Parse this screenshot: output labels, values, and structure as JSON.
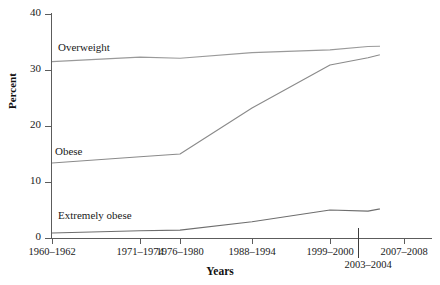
{
  "chart_data": {
    "type": "line",
    "title": "",
    "xlabel": "Years",
    "ylabel": "Percent",
    "categories": [
      "1960–1962",
      "1971–1974",
      "1976–1980",
      "1988–1994",
      "1999–2000",
      "2003–2004",
      "2007–2008"
    ],
    "ylim": [
      0,
      40
    ],
    "yticks": [
      0,
      10,
      20,
      30,
      40
    ],
    "ytick_labels": [
      "0",
      "10",
      "20",
      "30",
      "40"
    ],
    "grid": false,
    "legend": "inline-series-labels",
    "series": [
      {
        "name": "Overweight",
        "color": "#9a9a9a",
        "values": [
          31.5,
          32.3,
          32.1,
          33.1,
          33.6,
          34.2,
          34.3
        ]
      },
      {
        "name": "Obese",
        "color": "#8a8a8a",
        "values": [
          13.4,
          14.5,
          15.0,
          23.2,
          30.9,
          32.2,
          33.8
        ]
      },
      {
        "name": "Extremely obese",
        "color": "#6e6e6e",
        "values": [
          0.9,
          1.3,
          1.4,
          2.9,
          5.0,
          4.8,
          6.0
        ]
      }
    ],
    "axis_color": "#5c5c5c",
    "background": "#ffffff"
  },
  "axis": {
    "y": {
      "label": "Percent",
      "ticks": [
        {
          "value": 40,
          "label": "40"
        },
        {
          "value": 30,
          "label": "30"
        },
        {
          "value": 20,
          "label": "20"
        },
        {
          "value": 10,
          "label": "10"
        },
        {
          "value": 0,
          "label": "0"
        }
      ]
    },
    "x": {
      "label": "Years",
      "ticks": [
        {
          "label": "1960–1962",
          "row": 1
        },
        {
          "label": "1971–1974",
          "row": 1
        },
        {
          "label": "1976–1980",
          "row": 1
        },
        {
          "label": "1988–1994",
          "row": 1
        },
        {
          "label": "1999–2000",
          "row": 1
        },
        {
          "label": "2003–2004",
          "row": 2
        },
        {
          "label": "2007–2008",
          "row": 1
        }
      ]
    }
  },
  "series_labels": {
    "overweight": "Overweight",
    "obese": "Obese",
    "extremely_obese": "Extremely obese"
  }
}
